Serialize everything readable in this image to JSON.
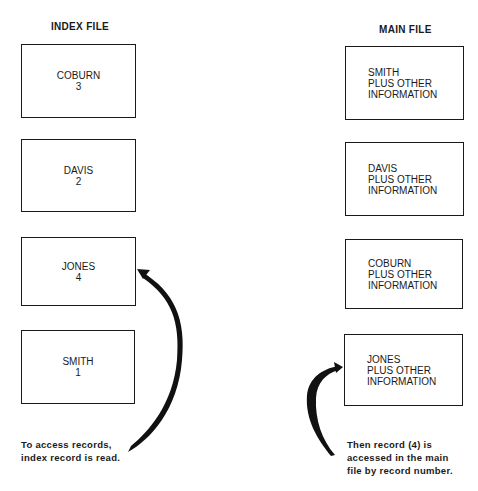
{
  "index_file": {
    "title": "INDEX FILE",
    "records": [
      {
        "name": "COBURN",
        "number": "3"
      },
      {
        "name": "DAVIS",
        "number": "2"
      },
      {
        "name": "JONES",
        "number": "4"
      },
      {
        "name": "SMITH",
        "number": "1"
      }
    ],
    "caption_lines": [
      "To access records,",
      "index record is read."
    ]
  },
  "main_file": {
    "title": "MAIN FILE",
    "records": [
      {
        "name": "SMITH",
        "line2": "PLUS OTHER",
        "line3": "INFORMATION"
      },
      {
        "name": "DAVIS",
        "line2": "PLUS OTHER",
        "line3": "INFORMATION"
      },
      {
        "name": "COBURN",
        "line2": "PLUS OTHER",
        "line3": "INFORMATION"
      },
      {
        "name": "JONES",
        "line2": "PLUS OTHER",
        "line3": "INFORMATION"
      }
    ],
    "caption_lines": [
      "Then record (4) is",
      "accessed in the main",
      "file by record number."
    ]
  }
}
